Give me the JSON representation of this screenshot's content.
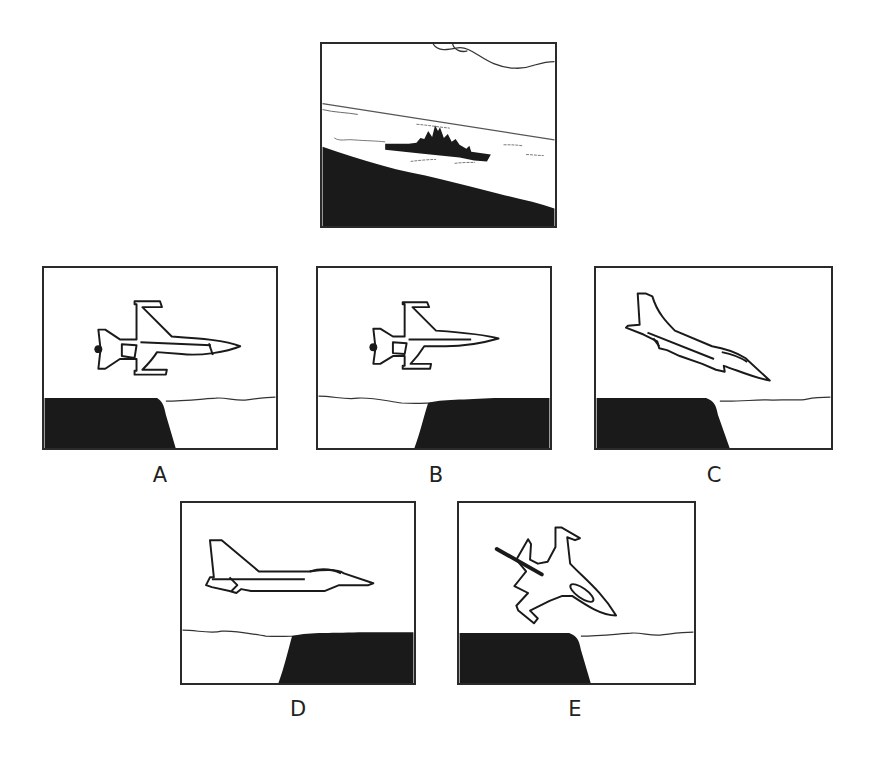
{
  "question": {
    "stimulus": {
      "description": "Warship on water viewed from a dark shoreline, horizon tilted",
      "icon": "ship-scene"
    },
    "options": [
      {
        "label": "A",
        "icon": "jet-topview-facing-right",
        "ground": "cliff-left"
      },
      {
        "label": "B",
        "icon": "jet-topview-facing-right",
        "ground": "cliff-right"
      },
      {
        "label": "C",
        "icon": "jet-side-diving-right",
        "ground": "cliff-left"
      },
      {
        "label": "D",
        "icon": "jet-side-level-right",
        "ground": "cliff-right"
      },
      {
        "label": "E",
        "icon": "jet-topview-banking-down-right",
        "ground": "cliff-left"
      }
    ]
  },
  "colors": {
    "border": "#2a2a2a",
    "fill": "#1a1a1a",
    "background": "#ffffff"
  }
}
